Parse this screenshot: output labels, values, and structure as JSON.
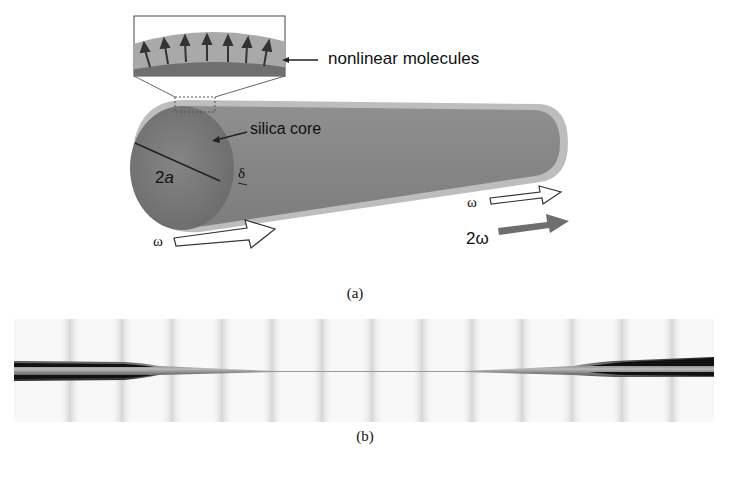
{
  "figure_a": {
    "inset_label": "nonlinear molecules",
    "core_label": "silica core",
    "diameter_label": "2a",
    "diameter_label_prefix": "2",
    "diameter_label_var": "a",
    "thickness_label": "δ",
    "input_label": "ω",
    "output_fundamental_label": "ω",
    "output_harmonic_label": "2ω",
    "caption": "(a)",
    "colors": {
      "fiber_body": "#8a8a8a",
      "fiber_cladding": "#b9b9b9",
      "core_end": "#7a7a7a",
      "harmonic_arrow": "#6e6e6e",
      "inset_background": "#a9a9a9",
      "inset_core": "#6f6f6f"
    },
    "inset_arrow_count": 7
  },
  "figure_b": {
    "caption": "(b)",
    "vertical_band_count": 13,
    "description": "micrograph of tapered fiber with thin waist at center"
  }
}
